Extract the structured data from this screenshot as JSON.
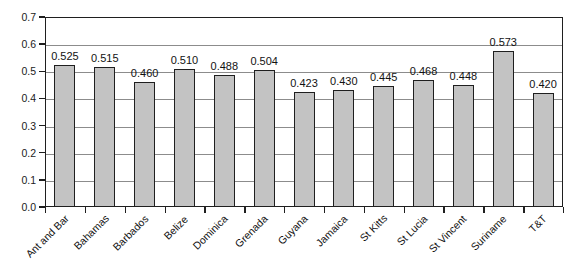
{
  "chart_data": {
    "type": "bar",
    "title": "",
    "xlabel": "",
    "ylabel": "",
    "ylim": [
      0.0,
      0.7
    ],
    "ytick_labels": [
      "0.0",
      "0.1",
      "0.2",
      "0.3",
      "0.4",
      "0.5",
      "0.6",
      "0.7"
    ],
    "ytick_values": [
      0.0,
      0.1,
      0.2,
      0.3,
      0.4,
      0.5,
      0.6,
      0.7
    ],
    "grid": true,
    "legend": "none",
    "bar_color": "#c3c3c3",
    "bar_border_color": "#1f1f1f",
    "categories": [
      "Ant and Bar",
      "Bahamas",
      "Barbados",
      "Belize",
      "Dominica",
      "Grenada",
      "Guyana",
      "Jamaica",
      "St Kitts",
      "St Lucia",
      "St Vincent",
      "Suriname",
      "T&T"
    ],
    "values": [
      0.525,
      0.515,
      0.46,
      0.51,
      0.488,
      0.504,
      0.423,
      0.43,
      0.445,
      0.468,
      0.448,
      0.573,
      0.42
    ],
    "value_labels": [
      "0.525",
      "0.515",
      "0.460",
      "0.510",
      "0.488",
      "0.504",
      "0.423",
      "0.430",
      "0.445",
      "0.468",
      "0.448",
      "0.573",
      "0.420"
    ]
  }
}
